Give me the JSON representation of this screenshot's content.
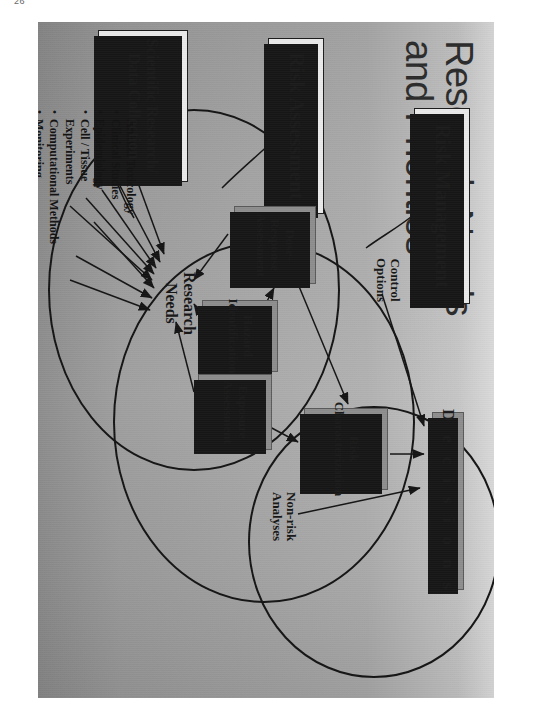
{
  "page": {
    "folio": "26"
  },
  "slide": {
    "title_line1": "Research Needs",
    "title_line2": "and Priorities"
  },
  "boxes": {
    "risk_management": "Risk Management",
    "risk_assessment": "Risk Assessment",
    "scientific_research": "Scientific Research/ Data Collection",
    "scientific_research_l1": "Scientific Research/",
    "scientific_research_l2": "Data Collection",
    "dose_response_l1": "Dose-Response",
    "dose_response_l2": "Assessment",
    "hazard_l1": "Hazard",
    "hazard_l2": "Identification",
    "exposure_l1": "Exposure",
    "exposure_l2": "Assessment",
    "risk_char_l1": "Risk",
    "risk_char_l2": "Characterization",
    "decisions": "Decisions"
  },
  "labels": {
    "control_l1": "Control",
    "control_l2": "Options",
    "nonrisk_l1": "Non-risk",
    "nonrisk_l2": "Analyses",
    "research_needs_l1": "Research",
    "research_needs_l2": "Needs"
  },
  "bullets": [
    "Animal Toxicology",
    "Clinical Studies",
    "Epidemiology",
    "Cell / Tissue",
    "Experiments",
    "Computational Methods",
    "Monitoring",
    "Surveillance"
  ],
  "colors": {
    "ink": "#141414",
    "box_gray": "#8d8d8d",
    "box_white": "#e9e9e9",
    "page_gray": "#a6a6a6"
  }
}
